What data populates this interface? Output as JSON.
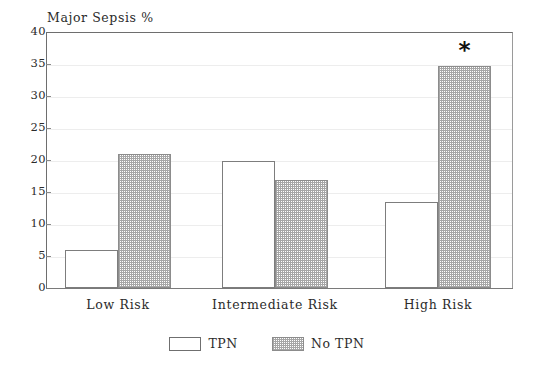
{
  "chart_data": {
    "type": "bar",
    "title": "Major Sepsis %",
    "xlabel": "",
    "ylabel": "",
    "ylim": [
      0,
      40
    ],
    "ytick_step": 5,
    "yticks": [
      40,
      35,
      30,
      25,
      20,
      15,
      10,
      5,
      0
    ],
    "grid": true,
    "grid_axis": "y",
    "legend_position": "bottom-center",
    "categories": [
      "Low Risk",
      "Intermediate Risk",
      "High Risk"
    ],
    "series": [
      {
        "name": "TPN",
        "fill": "white",
        "values": [
          6.0,
          19.8,
          13.5
        ]
      },
      {
        "name": "No TPN",
        "fill": "hatched-gray",
        "values": [
          20.9,
          16.8,
          34.7
        ]
      }
    ],
    "annotations": [
      {
        "text": "*",
        "category": "High Risk",
        "series": "No TPN",
        "meaning": "significance-marker"
      }
    ],
    "colors": {
      "axis": "#6e6e6e",
      "grid": "#ededed",
      "bar_outline": "#7d7d7d",
      "hatch": "#a6a6a6",
      "text": "#2b2b2b",
      "background": "#ffffff"
    }
  },
  "legend": {
    "items": [
      {
        "label": "TPN"
      },
      {
        "label": "No TPN"
      }
    ]
  }
}
